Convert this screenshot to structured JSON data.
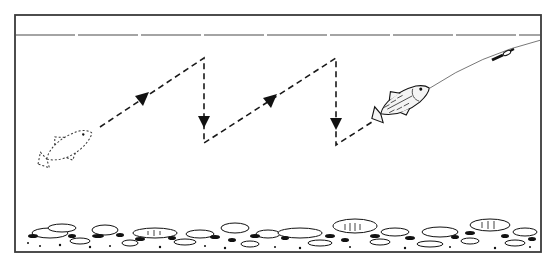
{
  "figure": {
    "description": "Jigging retrieve: lure follows a sawtooth path (diagonal rise, vertical drop) toward the angler's line",
    "frame": {
      "x": 15,
      "y": 15,
      "width": 526,
      "height": 237
    },
    "water_surface_y": 35,
    "colors": {
      "ink": "#111111",
      "frame": "#3a3a3a",
      "background": "#ffffff"
    },
    "lure_path": {
      "style": "dashed",
      "points": [
        [
          100,
          127
        ],
        [
          204,
          58
        ],
        [
          204,
          143
        ],
        [
          336,
          58
        ],
        [
          336,
          145
        ],
        [
          372,
          122
        ]
      ],
      "arrows": [
        {
          "x": 142,
          "y": 100,
          "direction": "up-right"
        },
        {
          "x": 204,
          "y": 122,
          "direction": "down"
        },
        {
          "x": 270,
          "y": 102,
          "direction": "up-right"
        },
        {
          "x": 336,
          "y": 124,
          "direction": "down"
        }
      ]
    },
    "ghost_fish": {
      "label": "starting position",
      "head": [
        92,
        133
      ],
      "tail": [
        36,
        165
      ],
      "style": "dotted"
    },
    "lure_fish": {
      "label": "baitfish lure",
      "head": [
        430,
        88
      ],
      "tail": [
        372,
        118
      ]
    },
    "fishing_line": {
      "from": [
        430,
        88
      ],
      "to": [
        541,
        40
      ]
    },
    "swivel": {
      "x": 503,
      "y": 55
    },
    "bottom": {
      "label": "rocky bottom",
      "top_y": 222
    }
  }
}
